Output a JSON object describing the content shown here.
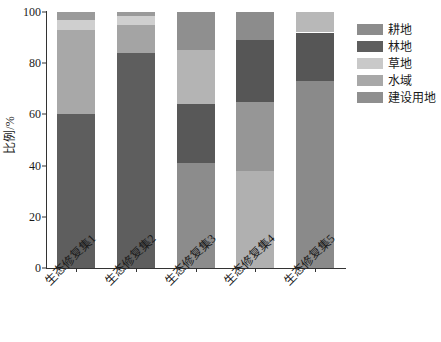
{
  "chart_data": {
    "type": "bar",
    "subtype": "stacked-bar-100-percent",
    "title": "",
    "xlabel": "",
    "ylabel": "比例/%",
    "ylim": [
      0,
      100
    ],
    "yticks": [
      0,
      20,
      40,
      60,
      80,
      100
    ],
    "grid": false,
    "legend_position": "right",
    "categories": [
      "生态修复集1",
      "生态修复集2",
      "生态修复集3",
      "生态修复集4",
      "生态修复集5"
    ],
    "series": [
      {
        "name": "耕地",
        "color": "#8c8c8c",
        "values": [
          0,
          0,
          41,
          0,
          73
        ]
      },
      {
        "name": "林地",
        "color": "#5e5e5e",
        "values": [
          60,
          84,
          23,
          24,
          19
        ]
      },
      {
        "name": "草地",
        "color": "#c9c9c9",
        "values": [
          4,
          3.5,
          21,
          0,
          8
        ]
      },
      {
        "name": "水域",
        "color": "#a8a8a8",
        "values": [
          33,
          11,
          0,
          38,
          0
        ]
      },
      {
        "name": "建设用地",
        "color": "#8f8f8f",
        "values": [
          3,
          1.5,
          15,
          38,
          0
        ]
      }
    ],
    "stacks": [
      {
        "category": "生态修复集1",
        "segments": [
          {
            "name": "林地",
            "from": 0,
            "to": 60,
            "color": "#5e5e5e"
          },
          {
            "name": "水域",
            "from": 60,
            "to": 93,
            "color": "#a8a8a8"
          },
          {
            "name": "草地",
            "from": 93,
            "to": 97,
            "color": "#cfcfcf"
          },
          {
            "name": "建设用地",
            "from": 97,
            "to": 100,
            "color": "#9a9a9a"
          }
        ]
      },
      {
        "category": "生态修复集2",
        "segments": [
          {
            "name": "林地",
            "from": 0,
            "to": 84,
            "color": "#5e5e5e"
          },
          {
            "name": "水域",
            "from": 84,
            "to": 95,
            "color": "#a4a4a4"
          },
          {
            "name": "草地",
            "from": 95,
            "to": 98.5,
            "color": "#cfcfcf"
          },
          {
            "name": "建设用地",
            "from": 98.5,
            "to": 100,
            "color": "#9a9a9a"
          }
        ]
      },
      {
        "category": "生态修复集3",
        "segments": [
          {
            "name": "耕地",
            "from": 0,
            "to": 41,
            "color": "#8c8c8c"
          },
          {
            "name": "林地",
            "from": 41,
            "to": 64,
            "color": "#585858"
          },
          {
            "name": "草地",
            "from": 64,
            "to": 85,
            "color": "#b4b4b4"
          },
          {
            "name": "建设用地",
            "from": 85,
            "to": 100,
            "color": "#8f8f8f"
          }
        ]
      },
      {
        "category": "生态修复集4",
        "segments": [
          {
            "name": "水域",
            "from": 0,
            "to": 38,
            "color": "#b0b0b0"
          },
          {
            "name": "建设用地",
            "from": 38,
            "to": 65,
            "color": "#969696"
          },
          {
            "name": "林地",
            "from": 65,
            "to": 89,
            "color": "#565656"
          },
          {
            "name": "耕地",
            "from": 89,
            "to": 100,
            "color": "#8c8c8c"
          }
        ]
      },
      {
        "category": "生态修复集5",
        "segments": [
          {
            "name": "耕地",
            "from": 0,
            "to": 73,
            "color": "#8a8a8a"
          },
          {
            "name": "林地",
            "from": 73,
            "to": 92,
            "color": "#565656"
          },
          {
            "name": "草地",
            "from": 92,
            "to": 100,
            "color": "#b8b8b8"
          }
        ]
      }
    ],
    "legend": [
      {
        "label": "耕地",
        "color": "#8c8c8c"
      },
      {
        "label": "林地",
        "color": "#5e5e5e"
      },
      {
        "label": "草地",
        "color": "#c9c9c9"
      },
      {
        "label": "水域",
        "color": "#a8a8a8"
      },
      {
        "label": "建设用地",
        "color": "#8f8f8f"
      }
    ]
  }
}
